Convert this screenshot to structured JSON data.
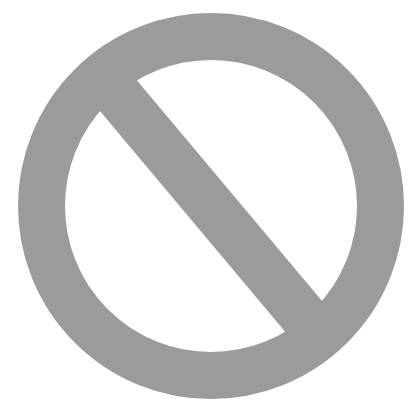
{
  "image": {
    "label": "Prohibited sign",
    "icon": "prohibited-icon",
    "colors": {
      "symbol": "#9b9b9b",
      "background": "#ffffff"
    },
    "geometry": {
      "center_x": 211,
      "center_y": 206,
      "outer_radius": 193,
      "inner_radius": 146,
      "slash_width": 48,
      "slash_angle_deg": 50
    }
  }
}
